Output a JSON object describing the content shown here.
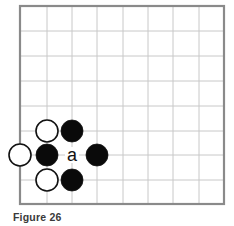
{
  "figure": {
    "caption": "Figure 26"
  },
  "board": {
    "x_lines": [
      20,
      47,
      72,
      97,
      123,
      148,
      173,
      199,
      224
    ],
    "y_lines": [
      6,
      31,
      56,
      81,
      106,
      131,
      155,
      180,
      204
    ],
    "border_color": "#8a8a8a",
    "grid_color": "#c8c8c8",
    "stone_radius": 11,
    "open_edges": [
      "left"
    ],
    "stones": [
      {
        "color": "white",
        "col": 1,
        "row": 5
      },
      {
        "color": "black",
        "col": 2,
        "row": 5
      },
      {
        "color": "white",
        "col": 0,
        "row": 6
      },
      {
        "color": "black",
        "col": 1,
        "row": 6
      },
      {
        "color": "black",
        "col": 3,
        "row": 6
      },
      {
        "color": "white",
        "col": 1,
        "row": 7
      },
      {
        "color": "black",
        "col": 2,
        "row": 7
      }
    ],
    "labels": [
      {
        "text": "a",
        "col": 2,
        "row": 6
      }
    ]
  }
}
